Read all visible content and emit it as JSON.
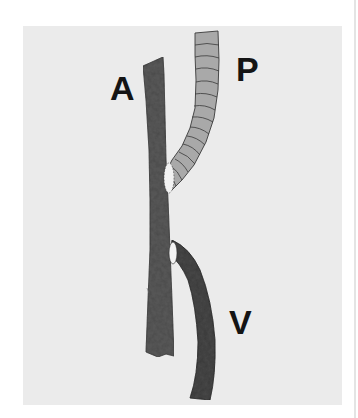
{
  "figure": {
    "labels": {
      "artery": "A",
      "pulmonary": "P",
      "vein": "V"
    },
    "colors": {
      "page_background": "#ffffff",
      "panel_background": "#ebebeb",
      "artery_fill": "#5c5c5c",
      "pulmonary_fill": "#a9a9a9",
      "pulmonary_ring": "#3a3a3a",
      "vein_fill": "#484848",
      "anastomosis_fill": "#f2f2f2",
      "label_color": "#141414"
    }
  }
}
